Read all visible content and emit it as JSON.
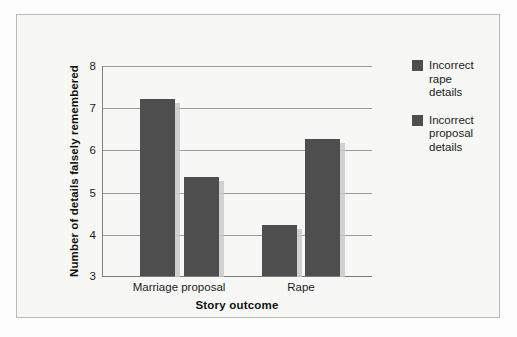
{
  "chart_data": {
    "type": "bar",
    "title": "",
    "xlabel": "Story outcome",
    "ylabel": "Number of details falsely remembered",
    "categories": [
      "Marriage proposal",
      "Rape"
    ],
    "series": [
      {
        "name": "Incorrect rape details",
        "values": [
          7.2,
          4.2
        ],
        "color": "#4e4e4e"
      },
      {
        "name": "Incorrect proposal details",
        "values": [
          5.35,
          6.25
        ],
        "color": "#4e4e4e"
      }
    ],
    "ylim": [
      3,
      8
    ],
    "ytick_labels": [
      "8",
      "7",
      "6",
      "5",
      "4",
      "3"
    ],
    "ytick_values": [
      8,
      7,
      6,
      5,
      4,
      3
    ],
    "grid": true,
    "legend_position": "right"
  },
  "legend": {
    "items": [
      {
        "line1": "Incorrect",
        "line2": "rape",
        "line3": "details"
      },
      {
        "line1": "Incorrect",
        "line2": "proposal",
        "line3": "details"
      }
    ]
  },
  "colors": {
    "bar_fill": "#4e4e4e",
    "gridline": "#9a9a9a",
    "axis": "#7a7a7a",
    "background": "#f7f7f6",
    "text": "#1b1b1b"
  }
}
